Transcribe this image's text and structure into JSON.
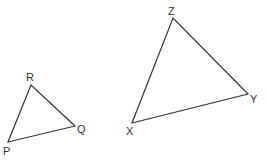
{
  "diagram": {
    "type": "similar-triangles",
    "stroke_color": "#333333",
    "triangles": [
      {
        "name": "PQR",
        "vertices": [
          {
            "label": "P",
            "x": 8,
            "y": 142
          },
          {
            "label": "Q",
            "x": 75,
            "y": 126
          },
          {
            "label": "R",
            "x": 31,
            "y": 85
          }
        ]
      },
      {
        "name": "XYZ",
        "vertices": [
          {
            "label": "X",
            "x": 132,
            "y": 123
          },
          {
            "label": "Y",
            "x": 248,
            "y": 94
          },
          {
            "label": "Z",
            "x": 173,
            "y": 18
          }
        ]
      }
    ]
  }
}
